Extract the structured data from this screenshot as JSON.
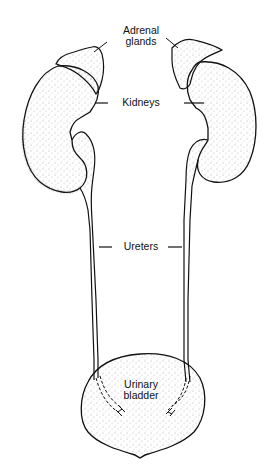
{
  "diagram": {
    "type": "anatomical-illustration",
    "labels": {
      "adrenal_line1": "Adrenal",
      "adrenal_line2": "glands",
      "kidneys": "Kidneys",
      "ureters": "Ureters",
      "bladder_line1": "Urinary",
      "bladder_line2": "bladder"
    },
    "colors": {
      "ink": "#111111",
      "background": "#ffffff",
      "stipple": "#555555"
    }
  }
}
